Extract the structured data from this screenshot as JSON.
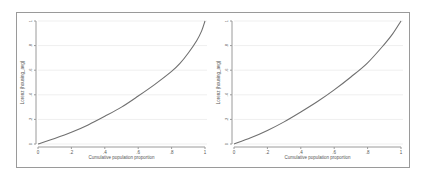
{
  "chart_data": [
    {
      "type": "line",
      "title": "",
      "xlabel": "Cumulative population proportion",
      "ylabel": "Lorenz (housing_avg)",
      "xlim": [
        0,
        1
      ],
      "ylim": [
        0,
        1
      ],
      "xticks": [
        "0",
        ".2",
        ".4",
        ".6",
        ".8",
        "1"
      ],
      "yticks": [
        "0",
        ".2",
        ".4",
        ".6",
        ".8",
        "1"
      ],
      "grid": true,
      "legend": null,
      "series": [
        {
          "name": "Lorenz curve",
          "x": [
            0,
            0.1,
            0.2,
            0.3,
            0.4,
            0.5,
            0.6,
            0.7,
            0.8,
            0.85,
            0.9,
            0.95,
            0.98,
            1.0
          ],
          "y": [
            0,
            0.045,
            0.095,
            0.155,
            0.225,
            0.3,
            0.39,
            0.485,
            0.59,
            0.655,
            0.74,
            0.84,
            0.92,
            1.0
          ]
        }
      ]
    },
    {
      "type": "line",
      "title": "",
      "xlabel": "Cumulative population proportion",
      "ylabel": "Lorenz (housing_avg)",
      "xlim": [
        0,
        1
      ],
      "ylim": [
        0,
        1
      ],
      "xticks": [
        "0",
        ".2",
        ".4",
        ".6",
        ".8",
        "1"
      ],
      "yticks": [
        "0",
        ".2",
        ".4",
        ".6",
        ".8",
        "1"
      ],
      "grid": true,
      "legend": null,
      "series": [
        {
          "name": "Lorenz curve",
          "x": [
            0,
            0.1,
            0.2,
            0.3,
            0.4,
            0.5,
            0.6,
            0.7,
            0.8,
            0.9,
            0.95,
            1.0
          ],
          "y": [
            0,
            0.05,
            0.11,
            0.18,
            0.26,
            0.345,
            0.44,
            0.545,
            0.66,
            0.81,
            0.895,
            1.0
          ]
        }
      ]
    }
  ],
  "colors": {
    "curve": "#707070",
    "axis": "#9a9a9a",
    "grid": "#efefef",
    "frame": "#9a9a9a"
  }
}
